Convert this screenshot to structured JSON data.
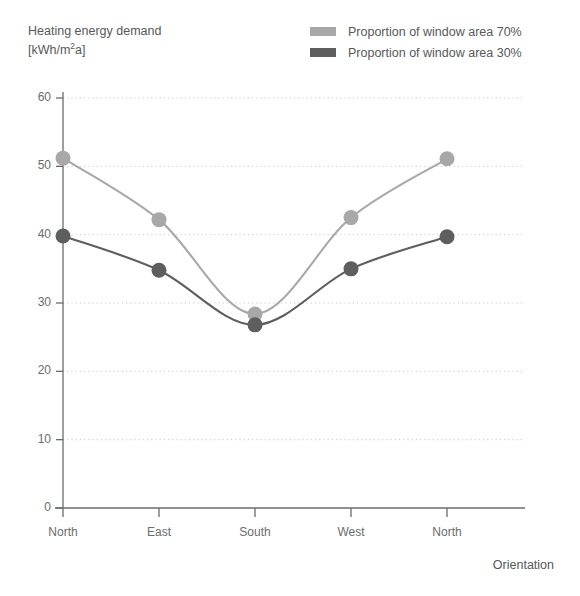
{
  "title_lines": [
    "Heating energy demand",
    "[kWh/m²a]"
  ],
  "y_axis_title_line1": "Heating energy demand",
  "y_axis_title_line2_pre": "[kWh/m",
  "y_axis_title_line2_exp": "2",
  "y_axis_title_line2_post": "a]",
  "x_axis_title": "Orientation",
  "legend": {
    "position": "top-right",
    "items": [
      {
        "label": "Proportion of window area 70%",
        "color": "#a8a8a8",
        "name": "series-70"
      },
      {
        "label": "Proportion of window area 30%",
        "color": "#5e5e5e",
        "name": "series-30"
      }
    ]
  },
  "colors": {
    "series_70": "#a8a8a8",
    "series_30": "#5e5e5e",
    "axis": "#6b6b6d",
    "grid": "#c9c9c9",
    "text": "#58585a"
  },
  "chart_data": {
    "type": "line",
    "title": "Heating energy demand [kWh/m2a]",
    "xlabel": "Orientation",
    "ylabel": "Heating energy demand [kWh/m2a]",
    "categories": [
      "North",
      "East",
      "South",
      "West",
      "North"
    ],
    "ylim": [
      0,
      60
    ],
    "yticks": [
      0,
      10,
      20,
      30,
      40,
      50,
      60
    ],
    "ytick_labels": [
      "0",
      "10",
      "20",
      "30",
      "40",
      "50",
      "60"
    ],
    "grid": true,
    "legend_position": "top-right",
    "markers": "circle",
    "series": [
      {
        "name": "Proportion of window area 70%",
        "color": "#a8a8a8",
        "values": [
          51.2,
          42.2,
          28.4,
          42.5,
          51.1
        ]
      },
      {
        "name": "Proportion of window area 30%",
        "color": "#5e5e5e",
        "values": [
          39.8,
          34.8,
          26.8,
          35.0,
          39.7
        ]
      }
    ]
  }
}
